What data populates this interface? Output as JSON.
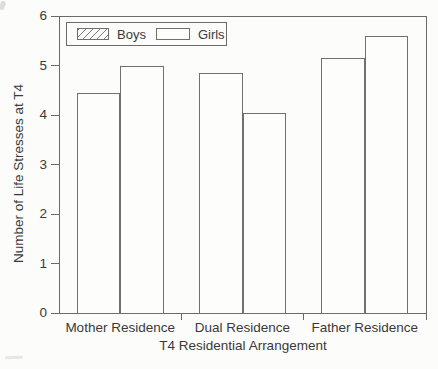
{
  "chart_data": {
    "type": "bar",
    "categories": [
      "Mother Residence",
      "Dual Residence",
      "Father Residence"
    ],
    "series": [
      {
        "name": "Boys",
        "style": "hatched",
        "values": [
          4.45,
          4.85,
          5.15
        ]
      },
      {
        "name": "Girls",
        "style": "open",
        "values": [
          5.0,
          4.05,
          5.6
        ]
      }
    ],
    "xlabel": "T4 Residential Arrangement",
    "ylabel": "Number of Life Stresses at T4",
    "ylim": [
      0,
      6
    ],
    "yticks": [
      0,
      1,
      2,
      3,
      4,
      5,
      6
    ],
    "grid": false,
    "legend": {
      "position": "inside-top-left",
      "items": [
        "Boys",
        "Girls"
      ]
    }
  },
  "colors": {
    "background": "#fcfcfa",
    "axis": "#6a6a6a",
    "bar_outline": "#707070",
    "hatch_line": "#7c7c7c",
    "bar_fill": "#fdfdfc",
    "text": "#3a3a3a"
  }
}
